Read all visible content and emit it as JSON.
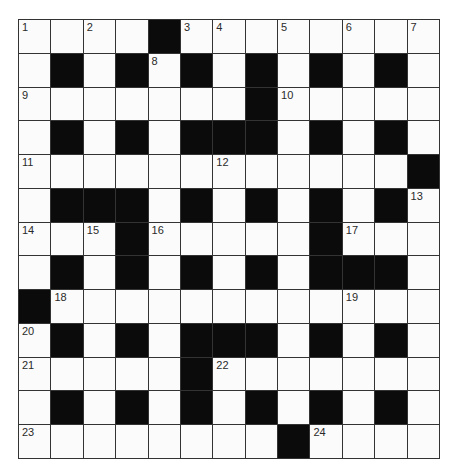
{
  "puzzle": {
    "rows": 13,
    "cols": 13,
    "colors": {
      "white": "#fbfbfb",
      "black": "#0b0b0b",
      "line": "#333333",
      "number": "#2a2a2a"
    },
    "grid": [
      "WWWWBWWWWWWWW",
      "WBWBWBWBWBWBW",
      "WWWWWWWBWWWWW",
      "WBWBWBBBWBWBW",
      "WWWWWWWWWWWWB",
      "WBBBWBWBWBWBW",
      "WWWBWWWWWBWWW",
      "WBWBWBWBWBBBW",
      "BWWWWWWWWWWWW",
      "WBWBWBBBWBWBW",
      "WWWWWBWWWWWWW",
      "WBWBWBWBWBWBW",
      "WWWWWWWWBWWWW"
    ],
    "numbers": [
      {
        "r": 0,
        "c": 0,
        "n": "1"
      },
      {
        "r": 0,
        "c": 2,
        "n": "2"
      },
      {
        "r": 0,
        "c": 5,
        "n": "3"
      },
      {
        "r": 0,
        "c": 6,
        "n": "4"
      },
      {
        "r": 0,
        "c": 8,
        "n": "5"
      },
      {
        "r": 0,
        "c": 10,
        "n": "6"
      },
      {
        "r": 0,
        "c": 12,
        "n": "7"
      },
      {
        "r": 1,
        "c": 4,
        "n": "8"
      },
      {
        "r": 2,
        "c": 0,
        "n": "9"
      },
      {
        "r": 2,
        "c": 8,
        "n": "10"
      },
      {
        "r": 4,
        "c": 0,
        "n": "11"
      },
      {
        "r": 4,
        "c": 6,
        "n": "12"
      },
      {
        "r": 5,
        "c": 12,
        "n": "13"
      },
      {
        "r": 6,
        "c": 0,
        "n": "14"
      },
      {
        "r": 6,
        "c": 2,
        "n": "15"
      },
      {
        "r": 6,
        "c": 4,
        "n": "16"
      },
      {
        "r": 6,
        "c": 10,
        "n": "17"
      },
      {
        "r": 8,
        "c": 1,
        "n": "18"
      },
      {
        "r": 8,
        "c": 10,
        "n": "19"
      },
      {
        "r": 9,
        "c": 0,
        "n": "20"
      },
      {
        "r": 10,
        "c": 0,
        "n": "21"
      },
      {
        "r": 10,
        "c": 6,
        "n": "22"
      },
      {
        "r": 12,
        "c": 0,
        "n": "23"
      },
      {
        "r": 12,
        "c": 9,
        "n": "24"
      }
    ]
  }
}
